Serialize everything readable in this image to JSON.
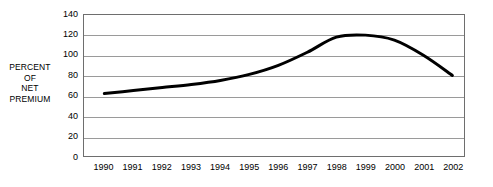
{
  "chart_data": {
    "type": "line",
    "title": "",
    "subtitle": "",
    "xlabel": "",
    "ylabel": "PERCENT OF NET PREMIUM",
    "ylabel_lines": [
      "PERCENT",
      "OF",
      "NET",
      "PREMIUM"
    ],
    "categories": [
      "1990",
      "1991",
      "1992",
      "1993",
      "1994",
      "1995",
      "1996",
      "1997",
      "1998",
      "1999",
      "2000",
      "2001",
      "2002"
    ],
    "x": [
      1990,
      1991,
      1992,
      1993,
      1994,
      1995,
      1996,
      1997,
      1998,
      1999,
      2000,
      2001,
      2002
    ],
    "series": [
      {
        "name": "Percent of net premium",
        "values": [
          62,
          65,
          68,
          71,
          75,
          81,
          90,
          103,
          118,
          120,
          115,
          100,
          80
        ],
        "color": "#000000",
        "line_width": 3
      }
    ],
    "y_ticks": [
      0,
      20,
      40,
      60,
      80,
      100,
      120,
      140
    ],
    "y_tick_labels": [
      "0",
      "20",
      "40",
      "60",
      "80",
      "100",
      "120",
      "140"
    ],
    "ylim": [
      0,
      140
    ],
    "xlim": [
      1989.3,
      2002.4
    ],
    "grid": true,
    "grid_axis": "y",
    "grid_color": "#9a9a9a",
    "frame_color": "#6e6e6e",
    "legend": false,
    "legend_position": "none",
    "background": "#ffffff",
    "annotations": []
  }
}
